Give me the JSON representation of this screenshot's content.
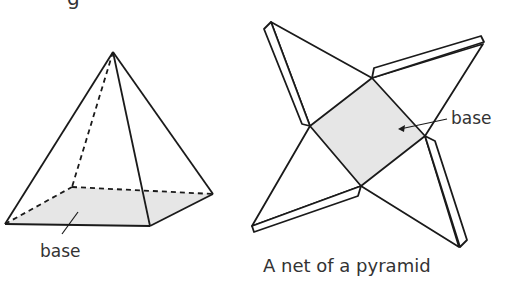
{
  "header": {
    "partial_text": "g"
  },
  "pyramid": {
    "label": "base",
    "fill": "#e6e6e6",
    "stroke": "#1a1a1a"
  },
  "net": {
    "label": "base",
    "caption": "A net of a pyramid",
    "fill": "#e6e6e6",
    "stroke": "#1a1a1a"
  }
}
